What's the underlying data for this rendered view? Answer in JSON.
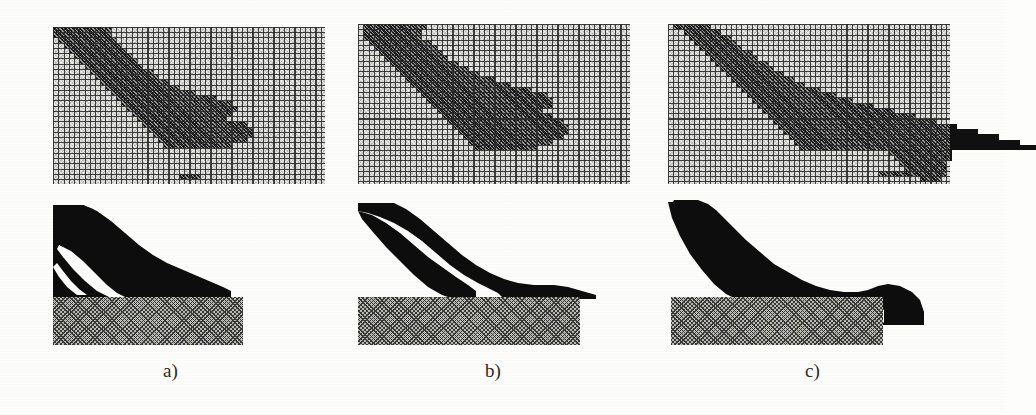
{
  "figure": {
    "type": "scanned-technical-figure",
    "background_color": "#fdfdfb",
    "material_color": "#0d0d0d",
    "void_color": "#d8d8d4",
    "base_hatch_color": "#b9b9b4",
    "grid_line_color": "#282828"
  },
  "panels": [
    {
      "id": "a",
      "caption": "a)",
      "caption_x": 163,
      "caption_y": 360,
      "grid": {
        "x": 53,
        "y": 27,
        "w": 272,
        "h": 157,
        "cols": 52,
        "rows": 30,
        "cell": 5.25
      },
      "silhouette": {
        "x": 53,
        "y": 205,
        "w": 272,
        "h": 120
      },
      "base": {
        "x": 53,
        "y": 297,
        "w": 190,
        "h": 48
      }
    },
    {
      "id": "b",
      "caption": "b)",
      "caption_x": 485,
      "caption_y": 360,
      "grid": {
        "x": 358,
        "y": 24,
        "w": 272,
        "h": 160,
        "cols": 52,
        "rows": 30,
        "cell": 5.25
      },
      "silhouette": {
        "x": 358,
        "y": 203,
        "w": 272,
        "h": 122
      },
      "base": {
        "x": 358,
        "y": 297,
        "w": 222,
        "h": 48
      }
    },
    {
      "id": "c",
      "caption": "c)",
      "caption_x": 805,
      "caption_y": 360,
      "grid": {
        "x": 668,
        "y": 24,
        "w": 282,
        "h": 160,
        "cols": 54,
        "rows": 30,
        "cell": 5.25
      },
      "silhouette": {
        "x": 668,
        "y": 200,
        "w": 290,
        "h": 125
      },
      "base": {
        "x": 671,
        "y": 297,
        "w": 212,
        "h": 48
      }
    }
  ],
  "chart_data": {
    "type": "heatmap",
    "title": "",
    "xlabel": "",
    "ylabel": "",
    "legend": [
      "solid material (black)",
      "void (light gray)",
      "fixed support (hatched)"
    ],
    "grid": true,
    "panel_a_cells": [
      [
        0,
        0,
        10,
        2
      ],
      [
        0,
        2,
        9,
        1
      ],
      [
        0,
        3,
        8,
        1
      ],
      [
        0,
        4,
        7,
        1
      ],
      [
        2,
        1,
        7,
        1
      ],
      [
        3,
        2,
        7,
        1
      ],
      [
        4,
        3,
        7,
        1
      ],
      [
        5,
        4,
        7,
        1
      ],
      [
        6,
        5,
        7,
        1
      ],
      [
        7,
        6,
        7,
        1
      ],
      [
        8,
        7,
        7,
        1
      ],
      [
        9,
        8,
        8,
        1
      ],
      [
        10,
        9,
        8,
        1
      ],
      [
        11,
        10,
        8,
        1
      ],
      [
        12,
        11,
        8,
        1
      ],
      [
        13,
        12,
        9,
        1
      ],
      [
        14,
        13,
        10,
        1
      ],
      [
        15,
        14,
        11,
        1
      ],
      [
        16,
        15,
        14,
        1
      ],
      [
        17,
        16,
        17,
        1
      ],
      [
        18,
        17,
        20,
        1
      ],
      [
        19,
        18,
        20,
        1
      ],
      [
        20,
        19,
        19,
        1
      ],
      [
        21,
        20,
        17,
        1
      ],
      [
        22,
        21,
        13,
        1
      ],
      [
        0,
        5,
        3,
        1
      ],
      [
        0,
        6,
        2,
        1
      ],
      [
        1,
        7,
        4,
        1
      ],
      [
        2,
        8,
        4,
        1
      ],
      [
        3,
        9,
        4,
        1
      ],
      [
        4,
        10,
        4,
        1
      ],
      [
        5,
        11,
        4,
        1
      ],
      [
        6,
        12,
        4,
        1
      ],
      [
        7,
        13,
        4,
        1
      ],
      [
        8,
        14,
        5,
        1
      ],
      [
        9,
        15,
        5,
        1
      ],
      [
        10,
        16,
        6,
        1
      ],
      [
        11,
        17,
        7,
        1
      ],
      [
        12,
        18,
        9,
        1
      ],
      [
        13,
        19,
        12,
        1
      ],
      [
        14,
        20,
        14,
        1
      ],
      [
        15,
        21,
        14,
        1
      ],
      [
        16,
        22,
        12,
        1
      ],
      [
        17,
        23,
        9,
        1
      ],
      [
        28,
        24,
        1,
        1
      ],
      [
        28,
        25,
        1,
        1
      ],
      [
        28,
        26,
        1,
        1
      ],
      [
        28,
        27,
        1,
        1
      ]
    ],
    "panel_b_cells": [
      [
        0,
        1,
        11,
        2
      ],
      [
        0,
        3,
        10,
        1
      ],
      [
        0,
        4,
        9,
        1
      ],
      [
        2,
        1,
        9,
        1
      ],
      [
        3,
        2,
        9,
        1
      ],
      [
        4,
        3,
        9,
        1
      ],
      [
        5,
        4,
        9,
        1
      ],
      [
        6,
        5,
        9,
        1
      ],
      [
        7,
        6,
        9,
        1
      ],
      [
        8,
        7,
        10,
        1
      ],
      [
        9,
        8,
        10,
        1
      ],
      [
        10,
        9,
        11,
        1
      ],
      [
        11,
        10,
        12,
        1
      ],
      [
        12,
        11,
        13,
        1
      ],
      [
        13,
        12,
        14,
        1
      ],
      [
        14,
        13,
        16,
        1
      ],
      [
        15,
        14,
        18,
        1
      ],
      [
        16,
        15,
        20,
        1
      ],
      [
        17,
        16,
        21,
        1
      ],
      [
        18,
        17,
        22,
        1
      ],
      [
        19,
        18,
        22,
        1
      ],
      [
        20,
        19,
        21,
        1
      ],
      [
        21,
        20,
        19,
        1
      ],
      [
        22,
        21,
        16,
        1
      ],
      [
        23,
        22,
        12,
        1
      ],
      [
        0,
        5,
        4,
        1
      ],
      [
        0,
        6,
        3,
        1
      ],
      [
        1,
        7,
        4,
        1
      ],
      [
        2,
        8,
        4,
        1
      ],
      [
        3,
        9,
        5,
        1
      ],
      [
        4,
        10,
        5,
        1
      ],
      [
        5,
        11,
        5,
        1
      ],
      [
        6,
        12,
        5,
        1
      ],
      [
        7,
        13,
        6,
        1
      ],
      [
        8,
        14,
        7,
        1
      ],
      [
        9,
        15,
        8,
        1
      ],
      [
        10,
        16,
        10,
        1
      ],
      [
        11,
        17,
        12,
        1
      ],
      [
        12,
        18,
        15,
        1
      ],
      [
        13,
        19,
        17,
        1
      ],
      [
        14,
        20,
        17,
        1
      ],
      [
        15,
        21,
        16,
        1
      ],
      [
        16,
        22,
        13,
        1
      ],
      [
        17,
        23,
        9,
        1
      ]
    ],
    "panel_c_cells": [
      [
        0,
        1,
        2,
        1
      ],
      [
        0,
        2,
        6,
        1
      ],
      [
        1,
        3,
        7,
        1
      ],
      [
        2,
        4,
        8,
        1
      ],
      [
        3,
        5,
        8,
        1
      ],
      [
        4,
        6,
        8,
        1
      ],
      [
        5,
        7,
        9,
        1
      ],
      [
        6,
        8,
        9,
        1
      ],
      [
        7,
        9,
        10,
        1
      ],
      [
        8,
        10,
        10,
        1
      ],
      [
        9,
        11,
        11,
        1
      ],
      [
        10,
        12,
        12,
        1
      ],
      [
        11,
        13,
        13,
        1
      ],
      [
        12,
        14,
        15,
        1
      ],
      [
        13,
        15,
        17,
        1
      ],
      [
        14,
        16,
        19,
        1
      ],
      [
        15,
        17,
        22,
        1
      ],
      [
        16,
        18,
        25,
        1
      ],
      [
        17,
        19,
        28,
        1
      ],
      [
        18,
        20,
        31,
        1
      ],
      [
        19,
        21,
        34,
        1
      ],
      [
        20,
        22,
        37,
        1
      ],
      [
        21,
        23,
        40,
        1
      ],
      [
        22,
        24,
        43,
        1
      ],
      [
        23,
        25,
        45,
        1
      ],
      [
        0,
        3,
        1,
        1
      ],
      [
        1,
        4,
        2,
        1
      ],
      [
        2,
        5,
        2,
        1
      ],
      [
        19,
        37,
        15,
        1
      ],
      [
        20,
        38,
        14,
        1
      ],
      [
        21,
        39,
        14,
        1
      ],
      [
        22,
        40,
        13,
        1
      ],
      [
        23,
        41,
        13,
        1
      ],
      [
        24,
        42,
        12,
        1
      ],
      [
        25,
        43,
        11,
        1
      ],
      [
        26,
        44,
        9,
        1
      ],
      [
        27,
        45,
        8,
        1
      ],
      [
        28,
        40,
        13,
        1
      ],
      [
        28,
        47,
        5,
        1
      ],
      [
        29,
        48,
        4,
        1
      ]
    ]
  }
}
